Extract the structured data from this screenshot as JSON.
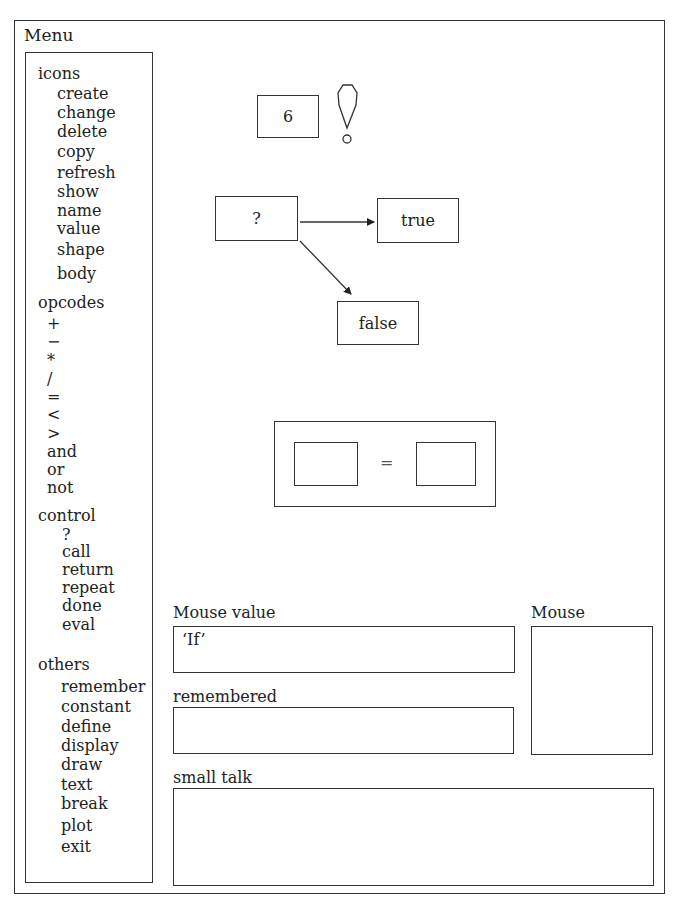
{
  "window": {
    "title": "Menu"
  },
  "menu": {
    "groups": [
      {
        "label": "icons",
        "items": [
          "create",
          "change",
          "delete",
          "copy",
          "refresh",
          "show",
          "name",
          "value",
          "shape",
          "body"
        ]
      },
      {
        "label": "opcodes",
        "items": [
          "+",
          "−",
          "*",
          "/",
          "=",
          "<",
          ">",
          "and",
          "or",
          "not"
        ]
      },
      {
        "label": "control",
        "items": [
          "?",
          "call",
          "return",
          "repeat",
          "done",
          "eval"
        ]
      },
      {
        "label": "others",
        "items": [
          "remember",
          "constant",
          "define",
          "display",
          "draw",
          "text",
          "break",
          "plot",
          "exit"
        ]
      }
    ]
  },
  "canvas": {
    "value_icon": {
      "value": "6"
    },
    "alert_icon": "exclamation-icon",
    "conditional": {
      "test": "?",
      "true_label": "true",
      "false_label": "false"
    },
    "comparison": {
      "operator": "="
    }
  },
  "panels": {
    "mouse_value": {
      "label": "Mouse value",
      "value": "‘If’"
    },
    "mouse": {
      "label": "Mouse"
    },
    "remembered": {
      "label": "remembered",
      "value": ""
    },
    "small_talk": {
      "label": "small talk",
      "value": ""
    }
  }
}
